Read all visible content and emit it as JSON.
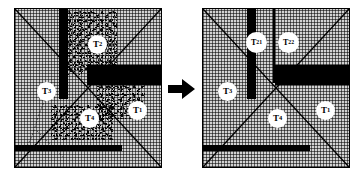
{
  "figure": {
    "background_color": "#ffffff",
    "panel_fill_color": "#c9c9c9",
    "bar_color": "#000000",
    "label_bg_color": "#ffffff",
    "transition": {
      "icon": "right-arrow-icon",
      "symbol": "➤"
    }
  },
  "panels": [
    {
      "id": "left",
      "name": "before-partition-panel",
      "labels": [
        {
          "id": "T1",
          "base": "T",
          "sub": "1",
          "x": 113,
          "y": 92
        },
        {
          "id": "T2",
          "base": "T",
          "sub": "2",
          "x": 73,
          "y": 26
        },
        {
          "id": "T3",
          "base": "T",
          "sub": "3",
          "x": 22,
          "y": 73
        },
        {
          "id": "T4",
          "base": "T",
          "sub": "4",
          "x": 65,
          "y": 100
        }
      ],
      "bars": [
        {
          "name": "vertical-bar",
          "x": 44,
          "y": 0,
          "w": 9,
          "h": 90
        },
        {
          "name": "horizontal-bar-middle",
          "x": 72,
          "y": 56,
          "w": 76,
          "h": 20
        },
        {
          "name": "horizontal-bar-bottom",
          "x": 0,
          "y": 136,
          "w": 107,
          "h": 6
        }
      ],
      "speckles": [
        {
          "name": "speckle-cloud-top",
          "x": 50,
          "y": 2,
          "w": 52,
          "h": 64
        },
        {
          "name": "speckle-cloud-right",
          "x": 82,
          "y": 76,
          "w": 48,
          "h": 34
        },
        {
          "name": "speckle-cloud-bottom",
          "x": 36,
          "y": 96,
          "w": 62,
          "h": 36
        }
      ]
    },
    {
      "id": "right",
      "name": "after-partition-panel",
      "labels": [
        {
          "id": "T1",
          "base": "T",
          "sub": "1",
          "x": 113,
          "y": 92
        },
        {
          "id": "T21",
          "base": "T",
          "sub": "21",
          "x": 43,
          "y": 23
        },
        {
          "id": "T22",
          "base": "T",
          "sub": "22",
          "x": 75,
          "y": 23
        },
        {
          "id": "T3",
          "base": "T",
          "sub": "3",
          "x": 15,
          "y": 73
        },
        {
          "id": "T4",
          "base": "T",
          "sub": "4",
          "x": 65,
          "y": 100
        }
      ],
      "bars": [
        {
          "name": "vertical-bar-thick",
          "x": 44,
          "y": 0,
          "w": 9,
          "h": 90
        },
        {
          "name": "vertical-line-thin",
          "x": 70,
          "y": 0,
          "w": 2,
          "h": 74
        },
        {
          "name": "horizontal-bar-middle",
          "x": 72,
          "y": 56,
          "w": 76,
          "h": 20
        },
        {
          "name": "horizontal-bar-bottom",
          "x": 0,
          "y": 136,
          "w": 107,
          "h": 6
        }
      ],
      "speckles": []
    }
  ]
}
